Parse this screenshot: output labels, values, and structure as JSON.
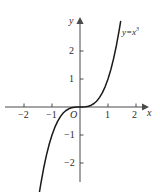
{
  "chart_data": {
    "type": "line",
    "title": "",
    "xlabel": "x",
    "ylabel": "y",
    "equation_label": "y=x",
    "equation_exponent": "3",
    "origin_label": "O",
    "xlim": [
      -2.7,
      2.7
    ],
    "ylim": [
      -2.9,
      2.9
    ],
    "grid": false,
    "legend": "none",
    "x_ticks": [
      {
        "value": -2,
        "label": "−2"
      },
      {
        "value": -1,
        "label": "−1"
      },
      {
        "value": 1,
        "label": "1"
      },
      {
        "value": 2,
        "label": "2"
      }
    ],
    "y_ticks": [
      {
        "value": 2,
        "label": "2"
      },
      {
        "value": 1,
        "label": "1"
      },
      {
        "value": -1,
        "label": "−1"
      },
      {
        "value": -2,
        "label": "−2"
      }
    ],
    "series": [
      {
        "name": "y=x^3",
        "function": "x^3",
        "color": "#1a1a1a",
        "x": [
          -1.45,
          -1.4,
          -1.3,
          -1.2,
          -1.1,
          -1.0,
          -0.9,
          -0.8,
          -0.7,
          -0.6,
          -0.5,
          -0.4,
          -0.3,
          -0.2,
          -0.1,
          0,
          0.1,
          0.2,
          0.3,
          0.4,
          0.5,
          0.6,
          0.7,
          0.8,
          0.9,
          1.0,
          1.1,
          1.2,
          1.3,
          1.4,
          1.45
        ],
        "y": [
          -3.05,
          -2.744,
          -2.197,
          -1.728,
          -1.331,
          -1.0,
          -0.729,
          -0.512,
          -0.343,
          -0.216,
          -0.125,
          -0.064,
          -0.027,
          -0.008,
          -0.001,
          0,
          0.001,
          0.008,
          0.027,
          0.064,
          0.125,
          0.216,
          0.343,
          0.512,
          0.729,
          1.0,
          1.331,
          1.728,
          2.197,
          2.744,
          3.05
        ]
      }
    ],
    "colors": {
      "curve": "#1a1a1a",
      "axis": "#4a4a4a",
      "text": "#2b2b2b",
      "background": "#ffffff"
    }
  }
}
